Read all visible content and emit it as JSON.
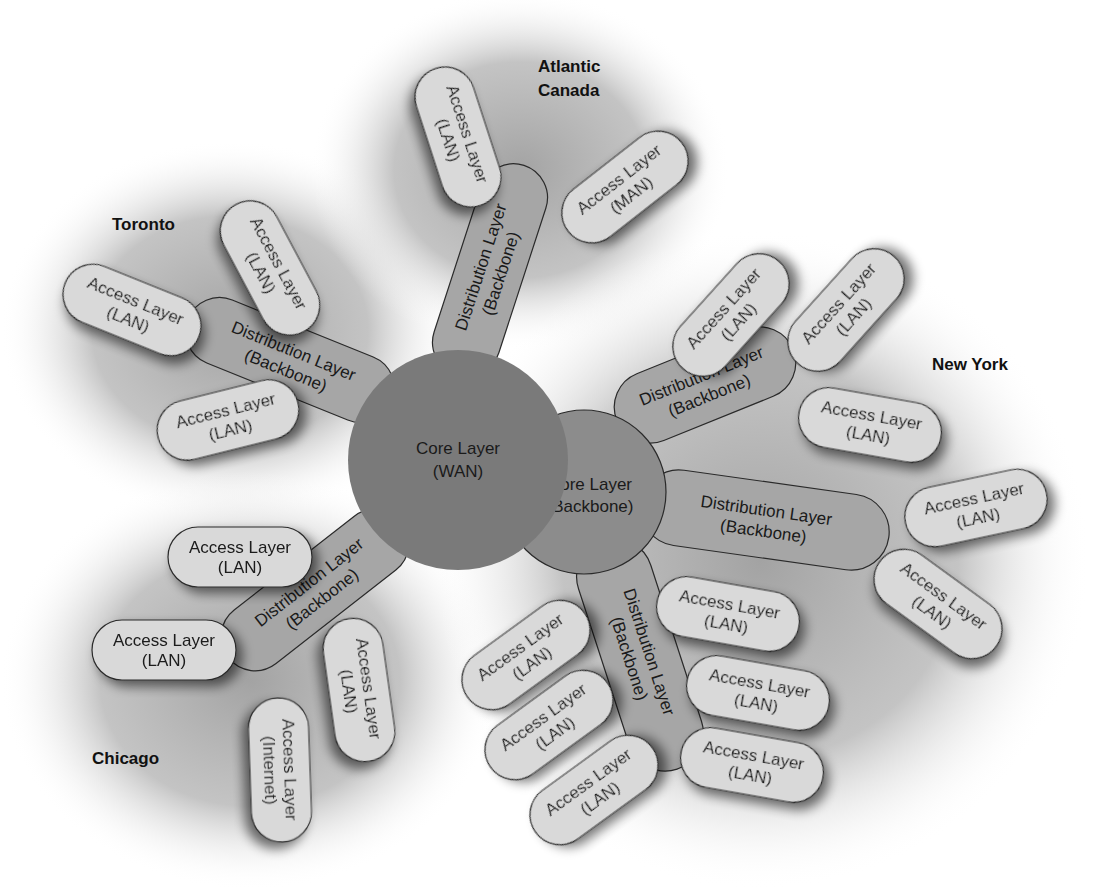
{
  "diagram": {
    "type": "hierarchical-network-topology",
    "colors": {
      "background": "#ffffff",
      "region_halo": "#b8b8b8",
      "core_wan": "#7a7a7a",
      "core_backbone": "#8c8c8c",
      "distribution": "#a6a6a6",
      "access": "#d9d9d9",
      "outline": "#2a2a2a"
    },
    "core": {
      "wan": {
        "line1": "Core Layer",
        "line2": "(WAN)"
      },
      "backbone": {
        "line1": "Core Layer",
        "line2": "(Backbone)"
      }
    },
    "regions": {
      "toronto": {
        "label": "Toronto",
        "distribution": {
          "line1": "Distribution Layer",
          "line2": "(Backbone)"
        },
        "access": [
          {
            "line1": "Access Layer",
            "line2": "(LAN)"
          },
          {
            "line1": "Access Layer",
            "line2": "(LAN)"
          },
          {
            "line1": "Access Layer",
            "line2": "(LAN)"
          }
        ]
      },
      "atlantic": {
        "label_line1": "Atlantic",
        "label_line2": "Canada",
        "distribution": {
          "line1": "Distribution Layer",
          "line2": "(Backbone)"
        },
        "access": [
          {
            "line1": "Access Layer",
            "line2": "(LAN)"
          },
          {
            "line1": "Access Layer",
            "line2": "(MAN)"
          }
        ]
      },
      "chicago": {
        "label": "Chicago",
        "distribution": {
          "line1": "Distribution Layer",
          "line2": "(Backbone)"
        },
        "access": [
          {
            "line1": "Access Layer",
            "line2": "(LAN)"
          },
          {
            "line1": "Access Layer",
            "line2": "(LAN)"
          },
          {
            "line1": "Access Layer",
            "line2": "(Internet)"
          },
          {
            "line1": "Access Layer",
            "line2": "(LAN)"
          }
        ]
      },
      "newyork": {
        "label": "New York",
        "distributions": [
          {
            "line1": "Distribution Layer",
            "line2": "(Backbone)",
            "access": [
              {
                "line1": "Access Layer",
                "line2": "(LAN)"
              },
              {
                "line1": "Access Layer",
                "line2": "(LAN)"
              },
              {
                "line1": "Access Layer",
                "line2": "(LAN)"
              }
            ]
          },
          {
            "line1": "Distribution Layer",
            "line2": "(Backbone)",
            "access": [
              {
                "line1": "Access Layer",
                "line2": "(LAN)"
              },
              {
                "line1": "Access Layer",
                "line2": "(LAN)"
              }
            ]
          },
          {
            "line1": "Distribution Layer",
            "line2": "(Backbone)",
            "access": [
              {
                "line1": "Access Layer",
                "line2": "(LAN)"
              },
              {
                "line1": "Access Layer",
                "line2": "(LAN)"
              },
              {
                "line1": "Access Layer",
                "line2": "(LAN)"
              },
              {
                "line1": "Access Layer",
                "line2": "(LAN)"
              },
              {
                "line1": "Access Layer",
                "line2": "(LAN)"
              },
              {
                "line1": "Access Layer",
                "line2": "(LAN)"
              }
            ]
          }
        ]
      }
    }
  }
}
